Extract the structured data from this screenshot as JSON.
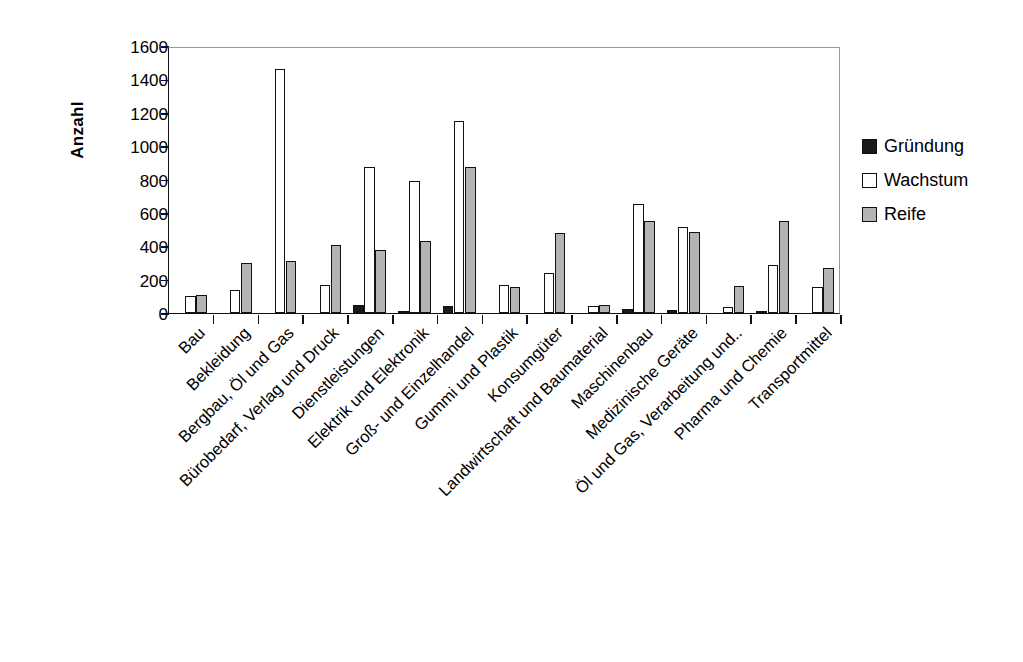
{
  "chart_data": {
    "type": "bar",
    "title": "",
    "subtitle": "",
    "xlabel": "",
    "ylabel": "Anzahl",
    "ylim": [
      0,
      1600
    ],
    "ytick_step": 200,
    "yticks": [
      0,
      200,
      400,
      600,
      800,
      1000,
      1200,
      1400,
      1600
    ],
    "ytick_labels": [
      "0",
      "200",
      "400",
      "600",
      "800",
      "1000",
      "1200",
      "1400",
      "1600"
    ],
    "grid": false,
    "legend_position": "right",
    "orientation": "vertical",
    "xtick_label_rotation": -45,
    "categories": [
      "Bau",
      "Bekleidung",
      "Bergbau, Öl und Gas",
      "Bürobedarf, Verlag und Druck",
      "Dienstleistungen",
      "Elektrik und Elektronik",
      "Groß- und Einzelhandel",
      "Gummi und Plastik",
      "Konsumgüter",
      "Landwirtschaft und Baumaterial",
      "Maschinenbau",
      "Medizinische Geräte",
      "Öl und Gas, Verarbeitung und..",
      "Pharma und Chemie",
      "Transportmittel"
    ],
    "series": [
      {
        "name": "Gründung",
        "color": "#1a1a1a",
        "values": [
          0,
          0,
          0,
          0,
          50,
          15,
          40,
          0,
          0,
          0,
          25,
          20,
          0,
          10,
          0
        ]
      },
      {
        "name": "Wachstum",
        "color": "#ffffff",
        "values": [
          100,
          140,
          1460,
          170,
          875,
          790,
          1150,
          165,
          240,
          40,
          655,
          515,
          35,
          285,
          155
        ]
      },
      {
        "name": "Reife",
        "color": "#b4b4b4",
        "values": [
          110,
          300,
          310,
          410,
          380,
          430,
          875,
          155,
          480,
          50,
          550,
          485,
          160,
          550,
          270
        ]
      }
    ]
  },
  "legend": {
    "entries": [
      {
        "label": "Gründung",
        "swatch": "gruendung"
      },
      {
        "label": "Wachstum",
        "swatch": "wachstum"
      },
      {
        "label": "Reife",
        "swatch": "reife"
      }
    ]
  }
}
